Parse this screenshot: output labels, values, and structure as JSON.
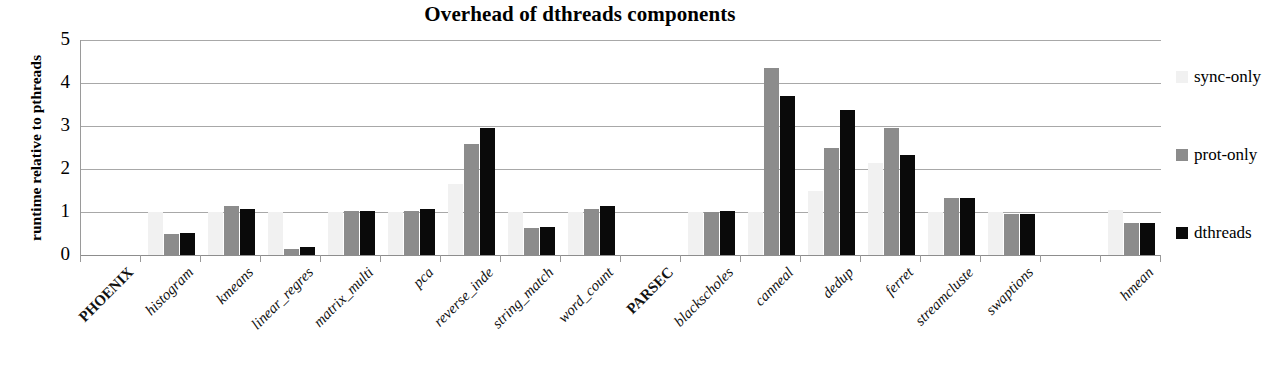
{
  "chart_data": {
    "type": "bar",
    "title": "Overhead of dthreads components",
    "xlabel": "",
    "ylabel": "runtime relative to pthreads",
    "ylim": [
      0,
      5
    ],
    "yticks": [
      0,
      1,
      2,
      3,
      4,
      5
    ],
    "grid": true,
    "legend_position": "right",
    "categories": [
      "PHOENIX",
      "histogram",
      "kmeans",
      "linear_regres",
      "matrix_multi",
      "pca",
      "reverse_inde",
      "string_match",
      "word_count",
      "PARSEC",
      "blackscholes",
      "canneal",
      "dedup",
      "ferret",
      "streamcluste",
      "swaptions",
      "",
      "hmean"
    ],
    "section_headers": [
      "PHOENIX",
      "PARSEC"
    ],
    "series": [
      {
        "name": "sync-only",
        "color": "#f1f1f1",
        "values": [
          null,
          1.0,
          1.0,
          1.0,
          1.0,
          1.0,
          1.65,
          1.0,
          1.0,
          null,
          1.0,
          1.0,
          1.48,
          2.13,
          1.0,
          1.0,
          null,
          1.05
        ]
      },
      {
        "name": "prot-only",
        "color": "#8c8c8c",
        "values": [
          null,
          0.5,
          1.15,
          0.15,
          1.03,
          1.03,
          2.58,
          0.63,
          1.08,
          null,
          1.0,
          4.35,
          2.5,
          2.95,
          1.33,
          0.95,
          null,
          0.75
        ]
      },
      {
        "name": "dthreads",
        "color": "#0a0a0a",
        "values": [
          null,
          0.52,
          1.08,
          0.18,
          1.03,
          1.08,
          2.95,
          0.65,
          1.15,
          null,
          1.03,
          3.7,
          3.38,
          2.32,
          1.33,
          0.95,
          null,
          0.75
        ]
      }
    ]
  },
  "legend": {
    "items": [
      {
        "label": "sync-only",
        "color": "#f1f1f1"
      },
      {
        "label": "prot-only",
        "color": "#8c8c8c"
      },
      {
        "label": "dthreads",
        "color": "#0a0a0a"
      }
    ]
  }
}
